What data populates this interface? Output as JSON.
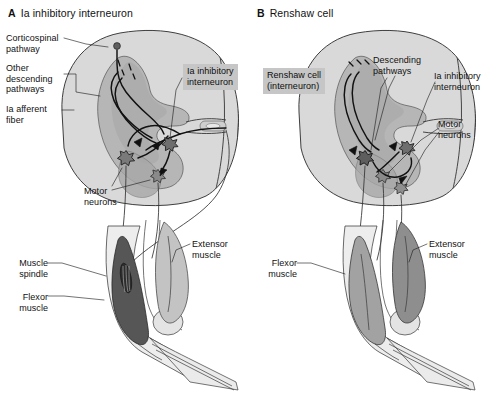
{
  "figure": {
    "background": "#ffffff",
    "ink": "#1a1a1a",
    "highlight_bg": "#c6c6c6",
    "white_matter": "#d8d8d8",
    "gray_matter": "#b4b4b4",
    "flexor_dark": "#5a5a5a",
    "muscle_mid": "#9a9a9a",
    "bone": "#e6e6e6"
  },
  "panels": [
    {
      "id": "a",
      "letter": "A",
      "title": "Ia inhibitory interneuron",
      "labels": [
        {
          "name": "corticospinal-pathway",
          "text": "Corticospinal\npathway",
          "x": 6,
          "y": 33,
          "align": "left"
        },
        {
          "name": "other-descending-pathways",
          "text": "Other\ndescending\npathways",
          "x": 6,
          "y": 63,
          "align": "left"
        },
        {
          "name": "ia-afferent-fiber",
          "text": "Ia afferent\nfiber",
          "x": 6,
          "y": 104,
          "align": "left"
        },
        {
          "name": "motor-neurons",
          "text": "Motor\nneurons",
          "x": 84,
          "y": 186,
          "align": "left"
        },
        {
          "name": "muscle-spindle",
          "text": "Muscle\nspindle",
          "x": 44,
          "y": 258,
          "align": "right"
        },
        {
          "name": "flexor-muscle",
          "text": "Flexor\nmuscle",
          "x": 44,
          "y": 292,
          "align": "right"
        },
        {
          "name": "extensor-muscle",
          "text": "Extensor\nmuscle",
          "x": 192,
          "y": 239,
          "align": "left"
        }
      ],
      "highlight_labels": [
        {
          "name": "ia-inhibitory-interneuron",
          "text": "Ia inhibitory\ninterneuron",
          "x": 183,
          "y": 64
        }
      ]
    },
    {
      "id": "b",
      "letter": "B",
      "title": "Renshaw cell",
      "labels": [
        {
          "name": "descending-pathways",
          "text": "Descending\npathways",
          "x": 373,
          "y": 55,
          "align": "left"
        },
        {
          "name": "ia-inhibitory-interneuron",
          "text": "Ia inhibitory\ninterneuron",
          "x": 434,
          "y": 71,
          "align": "left"
        },
        {
          "name": "motor-neurons",
          "text": "Motor\nneurons",
          "x": 438,
          "y": 119,
          "align": "left"
        },
        {
          "name": "flexor-muscle",
          "text": "Flexor\nmuscle",
          "x": 296,
          "y": 258,
          "align": "right"
        },
        {
          "name": "extensor-muscle",
          "text": "Extensor\nmuscle",
          "x": 424,
          "y": 239,
          "align": "left"
        }
      ],
      "highlight_labels": [
        {
          "name": "renshaw-cell-interneuron",
          "text": "Renshaw cell\n(interneuron)",
          "x": 263,
          "y": 68
        }
      ]
    }
  ]
}
